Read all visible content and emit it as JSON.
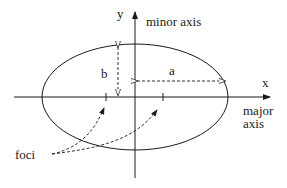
{
  "diagram": {
    "labels": {
      "y_axis": "y",
      "x_axis": "x",
      "minor_axis": "minor axis",
      "major_axis_line1": "major",
      "major_axis_line2": "axis",
      "semi_major": "a",
      "semi_minor": "b",
      "foci": "foci"
    },
    "colors": {
      "stroke": "#1a1a1a",
      "background": "#ffffff"
    }
  }
}
